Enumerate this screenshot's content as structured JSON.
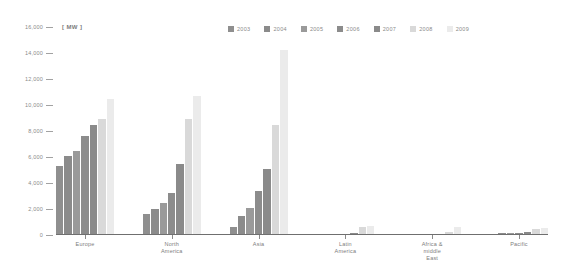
{
  "chart_data": {
    "type": "bar",
    "title": "",
    "subtitle": "",
    "unit_label": "[ MW ]",
    "xlabel": "",
    "ylabel": "",
    "ylim": [
      0,
      16000
    ],
    "grid": false,
    "legend_position": "top-right",
    "y_ticks": [
      {
        "value": 16000,
        "label": "16,000"
      },
      {
        "value": 14000,
        "label": "14,000"
      },
      {
        "value": 12000,
        "label": "12,000"
      },
      {
        "value": 10000,
        "label": "10,000"
      },
      {
        "value": 8000,
        "label": "8,000"
      },
      {
        "value": 6000,
        "label": "6,000"
      },
      {
        "value": 4000,
        "label": "4,000"
      },
      {
        "value": 2000,
        "label": "2,000"
      },
      {
        "value": 0,
        "label": "0"
      }
    ],
    "categories": [
      "Europe",
      "North America",
      "Asia",
      "Latin America",
      "Africa &\nmiddle East",
      "Pacific"
    ],
    "series": [
      {
        "name": "2003",
        "color": "#8f8f8f",
        "values": [
          5300,
          1650,
          620,
          60,
          40,
          110
        ]
      },
      {
        "name": "2004",
        "color": "#8b8b8b",
        "values": [
          6050,
          2000,
          1450,
          70,
          45,
          120
        ]
      },
      {
        "name": "2005",
        "color": "#9a9a9a",
        "values": [
          6450,
          2500,
          2050,
          90,
          50,
          130
        ]
      },
      {
        "name": "2006",
        "color": "#8c8c8c",
        "values": [
          7600,
          3200,
          3350,
          100,
          60,
          160
        ]
      },
      {
        "name": "2007",
        "color": "#8a8a8a",
        "values": [
          8500,
          5450,
          5050,
          170,
          70,
          230
        ]
      },
      {
        "name": "2008",
        "color": "#d9d9d9",
        "values": [
          8900,
          8950,
          8450,
          620,
          270,
          480
        ]
      },
      {
        "name": "2009",
        "color": "#ebebeb",
        "values": [
          10500,
          10700,
          14200,
          730,
          620,
          540
        ]
      }
    ]
  }
}
